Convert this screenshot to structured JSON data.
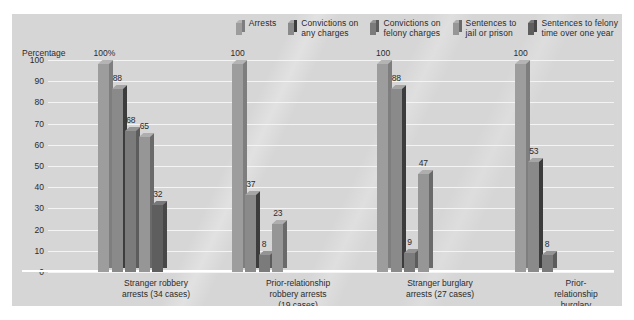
{
  "chart_data": {
    "type": "bar",
    "title": "",
    "subtitle": "",
    "xlabel": "",
    "ylabel": "Percentage",
    "ylim": [
      0,
      100
    ],
    "yticks": [
      "100",
      "90",
      "80",
      "70",
      "60",
      "50",
      "40",
      "30",
      "20",
      "10",
      "0"
    ],
    "grid": true,
    "legend_position": "top-right",
    "categories": [
      "Stranger robbery\narrests (34 cases)",
      "Prior-relationship\nrobbery arrests\n(19 cases)",
      "Stranger burglary\narrests (27 cases)",
      "Prior-relationship\nburglary arrests\n(17 cases)"
    ],
    "series": [
      {
        "name": "Arrests",
        "color": "#9d9d9d",
        "side_color": "#7e7e7e",
        "top_color": "#b4b4b4",
        "values": [
          100,
          100,
          100,
          100
        ],
        "labels": [
          "100%",
          "100",
          "100",
          "100"
        ]
      },
      {
        "name": "Convictions on\nany charges",
        "color": "#8a8a8a",
        "side_color": "#3c3c3c",
        "top_color": "#a5a5a5",
        "values": [
          88,
          37,
          88,
          53
        ],
        "labels": [
          "88",
          "37",
          "88",
          "53"
        ]
      },
      {
        "name": "Convictions on\nfelony charges",
        "color": "#7b7b7b",
        "side_color": "#5c5c5c",
        "top_color": "#949494",
        "values": [
          68,
          8,
          9,
          8
        ],
        "labels": [
          "68",
          "8",
          "9",
          "8"
        ]
      },
      {
        "name": "Sentences to\njail or prison",
        "color": "#969696",
        "side_color": "#6a6a6a",
        "top_color": "#aeaeae",
        "values": [
          65,
          23,
          47,
          null
        ],
        "labels": [
          "65",
          "23",
          "47",
          null
        ]
      },
      {
        "name": "Sentences to felony\ntime over one year",
        "color": "#5e5e5e",
        "side_color": "#474747",
        "top_color": "#787878",
        "values": [
          32,
          null,
          null,
          null
        ],
        "labels": [
          "32",
          null,
          null,
          null
        ]
      }
    ]
  },
  "axis": {
    "y_title": "Percentage"
  }
}
